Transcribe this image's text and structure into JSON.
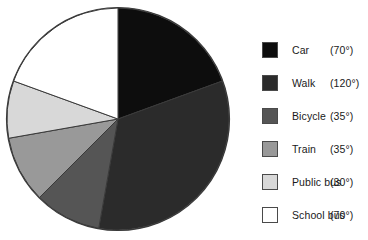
{
  "chart_data": {
    "type": "pie",
    "title": "",
    "subtitle": "",
    "xlabel": "",
    "ylabel": "",
    "units": "degrees",
    "total_degrees": 360,
    "start_angle_deg": 0,
    "direction": "clockwise",
    "legend_position": "right",
    "grid": false,
    "categories": [
      "Car",
      "Walk",
      "Bicycle",
      "Train",
      "Public bus",
      "School bus"
    ],
    "values": [
      70,
      120,
      35,
      35,
      30,
      70
    ],
    "value_labels": [
      "(70°)",
      "(120°)",
      "(35°)",
      "(35°)",
      "(30°)",
      "(70°)"
    ],
    "colors": [
      "#0d0d0d",
      "#2b2b2b",
      "#555555",
      "#999999",
      "#d8d8d8",
      "#ffffff"
    ],
    "slice_outline_color": "#3a3a3a",
    "slices": [
      {
        "label": "Car",
        "value": 70,
        "value_label": "(70°)",
        "color": "#0d0d0d",
        "start_deg": 0,
        "end_deg": 70
      },
      {
        "label": "Walk",
        "value": 120,
        "value_label": "(120°)",
        "color": "#2b2b2b",
        "start_deg": 70,
        "end_deg": 190
      },
      {
        "label": "Bicycle",
        "value": 35,
        "value_label": "(35°)",
        "color": "#555555",
        "start_deg": 190,
        "end_deg": 225
      },
      {
        "label": "Train",
        "value": 35,
        "value_label": "(35°)",
        "color": "#999999",
        "start_deg": 225,
        "end_deg": 260
      },
      {
        "label": "Public bus",
        "value": 30,
        "value_label": "(30°)",
        "color": "#d8d8d8",
        "start_deg": 260,
        "end_deg": 290
      },
      {
        "label": "School bus",
        "value": 70,
        "value_label": "(70°)",
        "color": "#ffffff",
        "start_deg": 290,
        "end_deg": 360
      }
    ]
  },
  "legend": {
    "rows": [
      {
        "label": "Car",
        "angle": "(70°)",
        "color": "#0d0d0d"
      },
      {
        "label": "Walk",
        "angle": "(120°)",
        "color": "#2b2b2b"
      },
      {
        "label": "Bicycle",
        "angle": "(35°)",
        "color": "#555555"
      },
      {
        "label": "Train",
        "angle": "(35°)",
        "color": "#999999"
      },
      {
        "label": "Public bus",
        "angle": "(30°)",
        "color": "#d8d8d8"
      },
      {
        "label": "School bus",
        "angle": "(70°)",
        "color": "#ffffff"
      }
    ]
  }
}
